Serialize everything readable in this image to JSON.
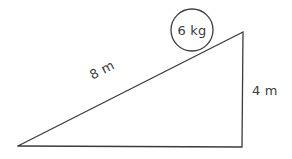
{
  "figure": {
    "background_color": "#ffffff",
    "stroke_color": "#3b3b3b",
    "text_color": "#3b3b3b",
    "stroke_width": 1.3
  },
  "triangle": {
    "name": "right-triangle-incline",
    "vertices": {
      "bottom_left": {
        "x": 18,
        "y": 146
      },
      "bottom_right": {
        "x": 242,
        "y": 147
      },
      "top_right": {
        "x": 243,
        "y": 32
      }
    },
    "points_attr": "18,146 242,147 243,32 18,146"
  },
  "labels": {
    "hypotenuse": {
      "text": "8 m",
      "x": 104,
      "y": 74,
      "rotation_deg": -27
    },
    "vertical_side": {
      "text": "4 m",
      "x": 252,
      "y": 95,
      "rotation_deg": 0
    },
    "mass": {
      "text": "6 kg",
      "x": 192,
      "y": 35
    }
  },
  "block": {
    "name": "mass-circle",
    "center": {
      "x": 192,
      "y": 30
    },
    "radius": 21
  }
}
